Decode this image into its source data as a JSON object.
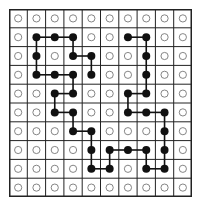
{
  "grid": {
    "rows": 10,
    "cols": 10,
    "line_color": "#222222",
    "open_circle_color": "#777777",
    "filled_dot_color": "#111111",
    "path_color": "#111111"
  },
  "path": [
    [
      3,
      4
    ],
    [
      2,
      4
    ],
    [
      2,
      3
    ],
    [
      1,
      3
    ],
    [
      1,
      2
    ],
    [
      1,
      1
    ],
    [
      2,
      1
    ],
    [
      3,
      1
    ],
    [
      3,
      2
    ],
    [
      3,
      3
    ],
    [
      4,
      3
    ],
    [
      4,
      2
    ],
    [
      5,
      2
    ],
    [
      5,
      3
    ],
    [
      6,
      3
    ],
    [
      6,
      4
    ],
    [
      7,
      4
    ],
    [
      8,
      4
    ],
    [
      8,
      5
    ],
    [
      7,
      5
    ],
    [
      7,
      6
    ],
    [
      7,
      7
    ],
    [
      8,
      7
    ],
    [
      8,
      8
    ],
    [
      7,
      8
    ],
    [
      6,
      8
    ],
    [
      5,
      8
    ],
    [
      5,
      7
    ],
    [
      5,
      6
    ],
    [
      4,
      6
    ],
    [
      4,
      7
    ],
    [
      3,
      7
    ],
    [
      2,
      7
    ],
    [
      1,
      7
    ],
    [
      1,
      6
    ]
  ]
}
